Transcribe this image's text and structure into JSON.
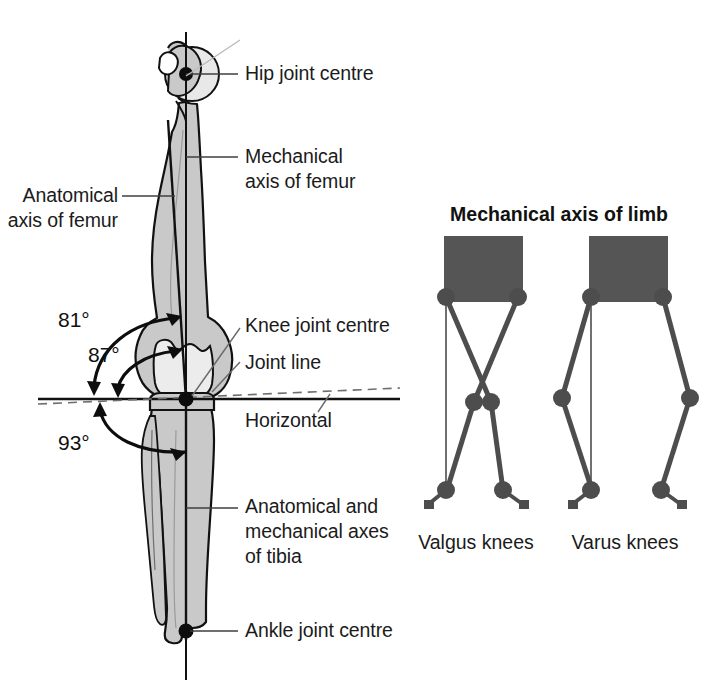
{
  "figure": {
    "width": 718,
    "height": 696,
    "background": "#ffffff",
    "colors": {
      "bone_fill": "#c9c9c9",
      "bone_fill_light": "#e3e3e3",
      "bone_outline": "#111111",
      "axis_line": "#111111",
      "leader_line": "#4a4a4a",
      "text": "#1b1b1b",
      "pelvis_block": "#555555",
      "limb_segment": "#4d4d4d",
      "joint_node": "#4d4d4d"
    }
  },
  "left_panel": {
    "name": "femur-tibia-axes-diagram",
    "labels": [
      {
        "id": "hip-joint-centre",
        "text": "Hip joint centre"
      },
      {
        "id": "mechanical-axis-femur",
        "text": "Mechanical\naxis of femur"
      },
      {
        "id": "anatomical-axis-femur",
        "text": "Anatomical\naxis of femur"
      },
      {
        "id": "knee-joint-centre",
        "text": "Knee joint centre"
      },
      {
        "id": "joint-line",
        "text": "Joint line"
      },
      {
        "id": "horizontal",
        "text": "Horizontal"
      },
      {
        "id": "axes-of-tibia",
        "text": "Anatomical and\nmechanical axes\nof tibia"
      },
      {
        "id": "ankle-joint-centre",
        "text": "Ankle joint centre"
      }
    ],
    "angles": [
      {
        "id": "angle-81",
        "value": "81°",
        "meaning": "anatomical axis of femur to horizontal"
      },
      {
        "id": "angle-87",
        "value": "87°",
        "meaning": "mechanical axis of femur to joint line"
      },
      {
        "id": "angle-93",
        "value": "93°",
        "meaning": "tibial axis to horizontal"
      }
    ]
  },
  "right_panel": {
    "name": "mechanical-axis-of-limb-panel",
    "title": "Mechanical axis of limb",
    "figures": [
      {
        "id": "valgus-knees",
        "caption": "Valgus knees"
      },
      {
        "id": "varus-knees",
        "caption": "Varus knees"
      }
    ]
  }
}
